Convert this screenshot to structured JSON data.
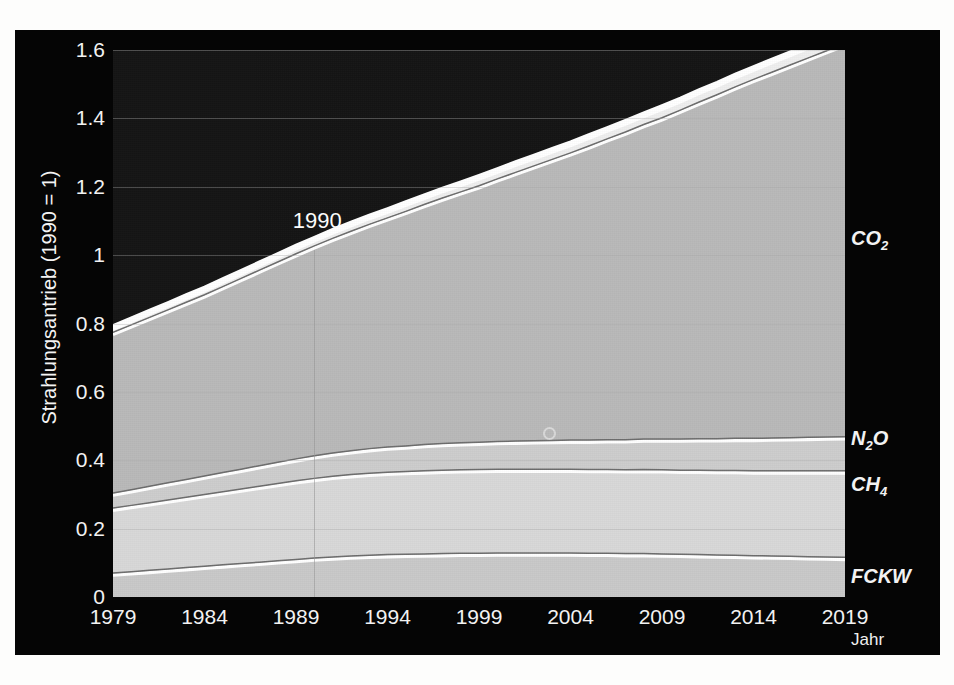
{
  "chart_data": {
    "type": "area",
    "title": "",
    "xlabel": "Jahr",
    "ylabel": "Strahlungsantrieb (1990 = 1)",
    "xlim": [
      1979,
      2019
    ],
    "ylim": [
      0,
      1.6
    ],
    "ytick_labels": [
      "0",
      "0.2",
      "0.4",
      "0.6",
      "0.8",
      "1",
      "1.2",
      "1.4",
      "1.6"
    ],
    "ytick_values": [
      0,
      0.2,
      0.4,
      0.6,
      0.8,
      1,
      1.2,
      1.4,
      1.6
    ],
    "xtick_labels": [
      "1979",
      "1984",
      "1989",
      "1994",
      "1999",
      "2004",
      "2009",
      "2014",
      "2019"
    ],
    "xtick_values": [
      1979,
      1984,
      1989,
      1994,
      1999,
      2004,
      2009,
      2014,
      2019
    ],
    "grid": true,
    "legend_position": "right-outside",
    "stacked": true,
    "x": [
      1979,
      1980,
      1981,
      1982,
      1983,
      1984,
      1985,
      1986,
      1987,
      1988,
      1989,
      1990,
      1991,
      1992,
      1993,
      1994,
      1995,
      1996,
      1997,
      1998,
      1999,
      2000,
      2001,
      2002,
      2003,
      2004,
      2005,
      2006,
      2007,
      2008,
      2009,
      2010,
      2011,
      2012,
      2013,
      2014,
      2015,
      2016,
      2017,
      2018,
      2019
    ],
    "series": [
      {
        "name": "FCKW",
        "label": "FCKW",
        "color": "#c9c9c9",
        "values": [
          0.07,
          0.074,
          0.078,
          0.082,
          0.086,
          0.09,
          0.094,
          0.098,
          0.102,
          0.106,
          0.11,
          0.114,
          0.117,
          0.12,
          0.122,
          0.124,
          0.125,
          0.126,
          0.127,
          0.128,
          0.128,
          0.129,
          0.129,
          0.129,
          0.129,
          0.129,
          0.128,
          0.128,
          0.127,
          0.127,
          0.126,
          0.125,
          0.124,
          0.123,
          0.122,
          0.121,
          0.12,
          0.119,
          0.118,
          0.117,
          0.116
        ]
      },
      {
        "name": "CH4",
        "label": "CH₄",
        "color": "#d8d8d8",
        "values": [
          0.19,
          0.194,
          0.198,
          0.202,
          0.206,
          0.21,
          0.214,
          0.218,
          0.222,
          0.226,
          0.23,
          0.233,
          0.236,
          0.238,
          0.24,
          0.241,
          0.242,
          0.243,
          0.244,
          0.244,
          0.245,
          0.245,
          0.245,
          0.245,
          0.245,
          0.245,
          0.245,
          0.245,
          0.245,
          0.246,
          0.246,
          0.246,
          0.247,
          0.247,
          0.248,
          0.248,
          0.249,
          0.25,
          0.251,
          0.252,
          0.253
        ]
      },
      {
        "name": "N2O",
        "label": "N₂O",
        "color": "#cdcdcd",
        "values": [
          0.044,
          0.046,
          0.048,
          0.05,
          0.052,
          0.054,
          0.056,
          0.058,
          0.06,
          0.062,
          0.064,
          0.066,
          0.068,
          0.07,
          0.072,
          0.074,
          0.075,
          0.077,
          0.078,
          0.079,
          0.08,
          0.081,
          0.082,
          0.083,
          0.084,
          0.085,
          0.086,
          0.087,
          0.088,
          0.089,
          0.09,
          0.091,
          0.092,
          0.093,
          0.094,
          0.095,
          0.096,
          0.097,
          0.098,
          0.099,
          0.1
        ]
      },
      {
        "name": "CO2",
        "label": "CO₂",
        "color": "#b9b9b9",
        "values": [
          0.47,
          0.482,
          0.494,
          0.506,
          0.518,
          0.53,
          0.544,
          0.558,
          0.572,
          0.586,
          0.6,
          0.614,
          0.628,
          0.642,
          0.656,
          0.67,
          0.686,
          0.702,
          0.718,
          0.734,
          0.75,
          0.768,
          0.786,
          0.804,
          0.822,
          0.84,
          0.86,
          0.88,
          0.9,
          0.92,
          0.94,
          0.962,
          0.984,
          1.006,
          1.028,
          1.05,
          1.07,
          1.09,
          1.11,
          1.13,
          1.15
        ]
      },
      {
        "name": "Uebrig",
        "label": "Übrig",
        "color": "#efefef",
        "values": [
          0.021,
          0.021,
          0.022,
          0.022,
          0.023,
          0.023,
          0.024,
          0.024,
          0.025,
          0.025,
          0.026,
          0.026,
          0.027,
          0.027,
          0.028,
          0.028,
          0.029,
          0.029,
          0.03,
          0.03,
          0.031,
          0.031,
          0.032,
          0.032,
          0.033,
          0.033,
          0.034,
          0.034,
          0.035,
          0.035,
          0.036,
          0.036,
          0.037,
          0.037,
          0.038,
          0.038,
          0.039,
          0.039,
          0.04,
          0.04,
          0.041
        ]
      }
    ],
    "annotations": [
      {
        "name": "marker-1990",
        "text": "1990",
        "x": 1990,
        "y": 1.045
      }
    ]
  }
}
